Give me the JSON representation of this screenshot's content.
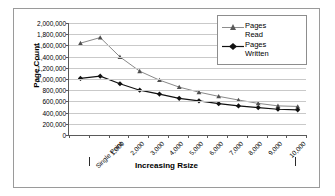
{
  "chart_data": {
    "type": "line",
    "title": "",
    "xlabel": "Increasing Rsize",
    "ylabel": "Page Count",
    "categories": [
      "Single Point",
      "1,000",
      "2,000",
      "3,000",
      "4,000",
      "5,000",
      "6,000",
      "7,000",
      "8,000",
      "9,000",
      "10,000"
    ],
    "x_tick_labels": [
      "Single Point",
      "1,000",
      "2,000",
      "3,000",
      "4,000",
      "5,000",
      "6,000",
      "7,000",
      "8,000",
      "9,000",
      "10,000"
    ],
    "y_tick_labels": [
      "2,000,000",
      "1,800,000",
      "1,600,000",
      "1,400,000",
      "1,200,000",
      "1,000,000",
      "800,000",
      "600,000",
      "400,000",
      "200,000",
      "0"
    ],
    "y_tick_values": [
      2000000,
      1800000,
      1600000,
      1400000,
      1200000,
      1000000,
      800000,
      600000,
      400000,
      200000,
      0
    ],
    "ylim": [
      0,
      2000000
    ],
    "grid": "horizontal",
    "legend_position": "top-right",
    "series": [
      {
        "name": "Pages Read",
        "legend_label_line1": "Pages",
        "legend_label_line2": "Read",
        "marker": "triangle",
        "color": "#7a7a7a",
        "x": [
          0,
          1,
          2,
          3,
          4,
          5,
          6,
          7,
          8,
          9,
          10,
          11
        ],
        "values": [
          1640000,
          1740000,
          1395000,
          1140000,
          980000,
          855000,
          765000,
          690000,
          625000,
          565000,
          520000,
          510000
        ]
      },
      {
        "name": "Pages Written",
        "legend_label_line1": "Pages",
        "legend_label_line2": "Written",
        "marker": "diamond",
        "color": "#111111",
        "x": [
          0,
          1,
          2,
          3,
          4,
          5,
          6,
          7,
          8,
          9,
          10,
          11
        ],
        "values": [
          1010000,
          1050000,
          915000,
          800000,
          730000,
          655000,
          610000,
          560000,
          520000,
          490000,
          460000,
          450000
        ]
      }
    ]
  },
  "axis": {
    "y_title": "Page Count",
    "x_title": "Increasing Rsize"
  }
}
